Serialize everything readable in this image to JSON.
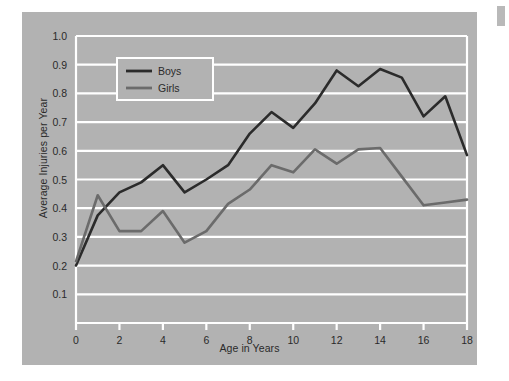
{
  "figure": {
    "background_color": "#ffffff",
    "panel_color": "#b2b2b2",
    "gridline_color": "#ffffff",
    "axis_color": "#ffffff",
    "text_color": "#2a2a2a"
  },
  "legend": {
    "position": "top-left-inside",
    "background_color": "#b2b2b2",
    "border_color": "#ffffff",
    "entries": [
      {
        "label": "Boys",
        "color": "#2b2b2b"
      },
      {
        "label": "Girls",
        "color": "#6b6b6b"
      }
    ]
  },
  "chart_data": {
    "type": "line",
    "title": "",
    "subtitle": "",
    "xlabel": "Age in Years",
    "ylabel": "Average Injuries per Year",
    "xlim": [
      0,
      18
    ],
    "ylim": [
      0,
      1.0
    ],
    "xticks": [
      0,
      2,
      4,
      6,
      8,
      10,
      12,
      14,
      16,
      18
    ],
    "xtick_labels": [
      "0",
      "2",
      "4",
      "6",
      "8",
      "10",
      "12",
      "14",
      "16",
      "18"
    ],
    "yticks": [
      0.1,
      0.2,
      0.3,
      0.4,
      0.5,
      0.6,
      0.7,
      0.8,
      0.9,
      1.0
    ],
    "ytick_labels": [
      "0.1",
      "0.2",
      "0.3",
      "0.4",
      "0.5",
      "0.6",
      "0.7",
      "0.8",
      "0.9",
      "1.0"
    ],
    "grid": true,
    "grid_axis": "y",
    "legend_position": "upper left",
    "x": [
      0,
      1,
      2,
      3,
      4,
      5,
      6,
      7,
      8,
      9,
      10,
      11,
      12,
      13,
      14,
      15,
      16,
      17,
      18
    ],
    "series": [
      {
        "name": "Boys",
        "color": "#2b2b2b",
        "values": [
          0.2,
          0.375,
          0.455,
          0.49,
          0.55,
          0.455,
          0.5,
          0.55,
          0.66,
          0.735,
          0.68,
          0.765,
          0.88,
          0.825,
          0.885,
          0.855,
          0.72,
          0.79,
          0.585
        ]
      },
      {
        "name": "Girls",
        "color": "#6b6b6b",
        "values": [
          0.215,
          0.445,
          0.32,
          0.32,
          0.39,
          0.28,
          0.32,
          0.415,
          0.465,
          0.55,
          0.525,
          0.605,
          0.555,
          0.605,
          0.61,
          0.51,
          0.41,
          0.42,
          0.43
        ]
      }
    ]
  }
}
